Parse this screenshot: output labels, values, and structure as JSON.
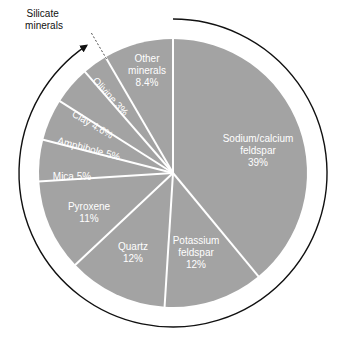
{
  "colors": {
    "slice": "#a3a3a3",
    "divider": "#ffffff",
    "label": "#ffffff",
    "arc": "#111111"
  },
  "geometry": {
    "cx": 173,
    "cy": 173,
    "r": 134,
    "arc_r": 154
  },
  "annotation": {
    "line1": "Silicate",
    "line2": "minerals"
  },
  "chart_data": {
    "type": "pie",
    "title": "",
    "start_angle_deg": 0,
    "direction": "clockwise",
    "categories": [
      "Sodium/calcium feldspar",
      "Potassium feldspar",
      "Quartz",
      "Pyroxene",
      "Mica",
      "Amphibole",
      "Clay",
      "Olivine",
      "Other minerals"
    ],
    "values": [
      39,
      12,
      12,
      11,
      5,
      5,
      4.6,
      3,
      8.4
    ],
    "unit": "%",
    "annotation": "Silicate minerals (arc spanning all slices except Other minerals)",
    "slices": [
      {
        "name": "Sodium/calcium feldspar",
        "value": 39,
        "lines": [
          "Sodium/calcium",
          "feldspar",
          "39%"
        ],
        "lx": 258,
        "ly": 150,
        "rot": 0
      },
      {
        "name": "Potassium feldspar",
        "value": 12,
        "lines": [
          "Potassium",
          "feldspar",
          "12%"
        ],
        "lx": 196,
        "ly": 252,
        "rot": 0
      },
      {
        "name": "Quartz",
        "value": 12,
        "lines": [
          "Quartz",
          "12%"
        ],
        "lx": 133,
        "ly": 252,
        "rot": 0
      },
      {
        "name": "Pyroxene",
        "value": 11,
        "lines": [
          "Pyroxene",
          "11%"
        ],
        "lx": 89,
        "ly": 212,
        "rot": 0
      },
      {
        "name": "Mica",
        "value": 5,
        "lines": [
          "Mica 5%"
        ],
        "lx": 72,
        "ly": 176,
        "rot": 0
      },
      {
        "name": "Amphibole",
        "value": 5,
        "lines": [
          "Amphibole 5%"
        ],
        "lx": 89,
        "ly": 148,
        "rot": 15
      },
      {
        "name": "Clay",
        "value": 4.6,
        "lines": [
          "Clay 4.6%"
        ],
        "lx": 93,
        "ly": 124,
        "rot": 30
      },
      {
        "name": "Olivine",
        "value": 3,
        "lines": [
          "Olivine 3%"
        ],
        "lx": 111,
        "ly": 96,
        "rot": 48
      },
      {
        "name": "Other minerals",
        "value": 8.4,
        "lines": [
          "Other",
          "minerals",
          "8.4%"
        ],
        "lx": 147,
        "ly": 70,
        "rot": 0
      }
    ]
  }
}
